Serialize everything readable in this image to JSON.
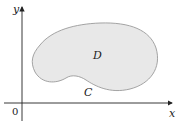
{
  "diagram": {
    "type": "region-with-boundary",
    "axes": {
      "x_label": "x",
      "y_label": "y",
      "origin_label": "0"
    },
    "region": {
      "label": "D",
      "fill": "#e8e8e8",
      "stroke": "#9a9a9a"
    },
    "boundary": {
      "label": "C"
    }
  }
}
